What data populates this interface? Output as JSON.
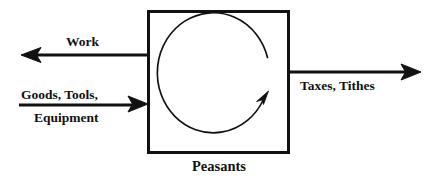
{
  "diagram": {
    "type": "flow-diagram",
    "background_color": "#ffffff",
    "stroke_color": "#111111",
    "entity": {
      "label": "Peasants",
      "shape": "rectangle",
      "internal_symbol": "clockwise-circular-arrow"
    },
    "flows": [
      {
        "id": "work",
        "label": "Work",
        "direction": "out-left",
        "arrow": "left"
      },
      {
        "id": "goods-tools-equipment",
        "label_line1": "Goods, Tools,",
        "label_line2": "Equipment",
        "direction": "in-left",
        "arrow": "right"
      },
      {
        "id": "taxes-tithes",
        "label": "Taxes, Tithes",
        "direction": "out-right",
        "arrow": "right"
      }
    ]
  }
}
